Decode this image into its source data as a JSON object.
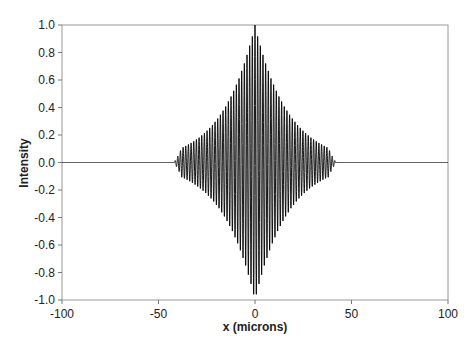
{
  "chart_data": {
    "type": "line",
    "title": "",
    "xlabel": "x (microns)",
    "ylabel": "Intensity",
    "xlim": [
      -100,
      100
    ],
    "ylim": [
      -1.0,
      1.0
    ],
    "x_ticks": [
      "-100",
      "-50",
      "0",
      "50",
      "100"
    ],
    "y_ticks": [
      "1.0",
      "0.8",
      "0.6",
      "0.4",
      "0.2",
      "0.0",
      "-0.2",
      "-0.4",
      "-0.6",
      "-0.8",
      "-1.0"
    ],
    "grid": false,
    "legend": null,
    "series": [
      {
        "name": "Intensity",
        "description": "Interferogram: cosine fringes under a symmetric decaying envelope centered at x=0",
        "fringe_period_microns": 1.38,
        "envelope": "exp(-|x|/17)",
        "peak_amplitude": 1.0,
        "support_microns": [
          -40,
          40
        ],
        "sample_points": {
          "x": [
            -100,
            -40,
            -30,
            -20,
            -10,
            0,
            10,
            20,
            30,
            40,
            100
          ],
          "envelope": [
            0.0,
            0.01,
            0.17,
            0.31,
            0.56,
            1.0,
            0.56,
            0.31,
            0.17,
            0.01,
            0.0
          ]
        },
        "color": "#000000"
      }
    ]
  }
}
